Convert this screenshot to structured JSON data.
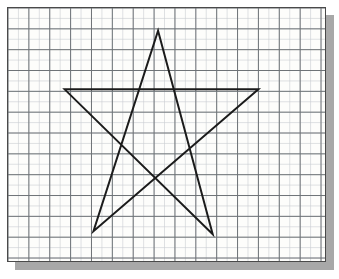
{
  "scene": {
    "title": "Pentagram drawn on graph paper",
    "width": 339,
    "height": 279,
    "background_color": "#ffffff"
  },
  "paper": {
    "label": "graph-paper-sheet",
    "left": 7,
    "top": 7,
    "width": 319,
    "height": 255,
    "fill_color": "#fdfdfb",
    "border_color": "#4a4a4a",
    "shadow_color": "#a8a8a8",
    "shadow_offset": 8
  },
  "grid": {
    "label": "graph-paper-grid",
    "minor_spacing": 10.5,
    "major_spacing": 21,
    "minor_color": "#c9cdd2",
    "major_color": "#6d7276",
    "major_columns": 15,
    "major_rows": 12,
    "origin_x": 7,
    "origin_y": 7
  },
  "drawing": {
    "label": "five-pointed-star",
    "shape_name": "pentagram",
    "stroke_color": "#1b1b1b",
    "stroke_width": 2.0,
    "closed": true,
    "vertex_order": [
      "top-apex",
      "bottom-right-leg",
      "left-arm-tip",
      "right-arm-tip",
      "bottom-left-leg"
    ],
    "points_px": [
      {
        "name": "top-apex",
        "x": 158,
        "y": 30
      },
      {
        "name": "bottom-right-leg",
        "x": 213,
        "y": 235
      },
      {
        "name": "left-arm-tip",
        "x": 64,
        "y": 89
      },
      {
        "name": "right-arm-tip",
        "x": 259,
        "y": 89
      },
      {
        "name": "bottom-left-leg",
        "x": 93,
        "y": 232
      }
    ],
    "path_d": "M 151,23 L 206,228 L 57,82 L 252,82 L 86,225 Z"
  }
}
